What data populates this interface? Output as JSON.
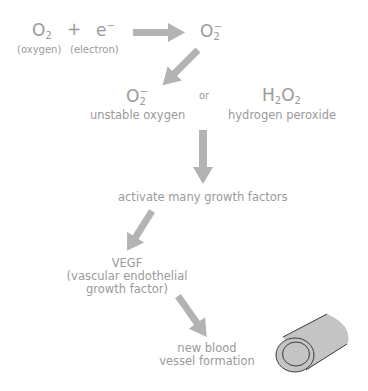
{
  "reaction": {
    "reactant1": {
      "symbol": "O",
      "sub": "2",
      "label": "(oxygen)"
    },
    "plus": "+",
    "reactant2": {
      "symbol": "e",
      "sup": "−",
      "label": "(electron)"
    },
    "product": {
      "symbol": "O",
      "sub": "2",
      "sup": "−"
    }
  },
  "species": {
    "superoxide": {
      "symbol": "O",
      "sub": "2",
      "sup": "−",
      "label": "unstable oxygen"
    },
    "or": "or",
    "peroxide": {
      "h": "H",
      "hsub": "2",
      "o": "O",
      "osub": "2",
      "label": "hydrogen peroxide"
    }
  },
  "steps": {
    "growth_factors": "activate many growth factors",
    "vegf_title": "VEGF",
    "vegf_line1": "(vascular endothelial",
    "vegf_line2": "growth factor)",
    "vessel_line1": "new blood",
    "vessel_line2": "vessel formation"
  },
  "colors": {
    "text": "#9a9a9a",
    "arrow": "#b3b3b3",
    "vessel_fill": "#c4c4c4",
    "vessel_stroke": "#3a3a3a"
  },
  "icons": {
    "arrows": [
      "arrow-right-icon",
      "arrow-down-left-icon",
      "arrow-down-icon",
      "arrow-down-left-icon",
      "arrow-down-right-icon"
    ],
    "vessel": "blood-vessel-icon"
  }
}
